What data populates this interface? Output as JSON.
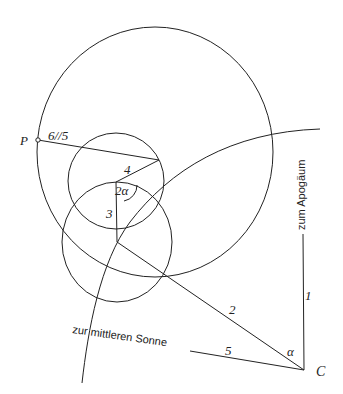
{
  "diagram": {
    "labels": {
      "point_p": "P",
      "segment_6_5": "6//5",
      "segment_4": "4",
      "angle_2a": "2α",
      "segment_3": "3",
      "segment_2": "2",
      "segment_1": "1",
      "segment_5": "5",
      "angle_a": "α",
      "point_c": "C",
      "to_apogee": "zum Apogäum",
      "to_mean_sun": "zur mittleren Sonne"
    },
    "colors": {
      "stroke": "#222222",
      "background": "#ffffff"
    }
  }
}
